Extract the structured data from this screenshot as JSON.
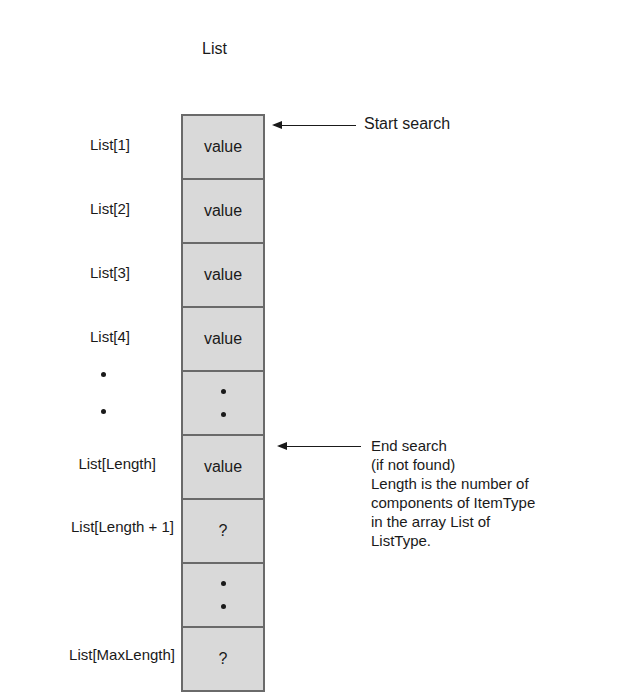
{
  "diagram": {
    "title": "List",
    "cells": [
      {
        "index_label": "List[1]",
        "content": "value",
        "type": "text"
      },
      {
        "index_label": "List[2]",
        "content": "value",
        "type": "text"
      },
      {
        "index_label": "List[3]",
        "content": "value",
        "type": "text"
      },
      {
        "index_label": "List[4]",
        "content": "value",
        "type": "text"
      },
      {
        "index_label": "",
        "content": "",
        "type": "ellipsis"
      },
      {
        "index_label": "List[Length]",
        "content": "value",
        "type": "text"
      },
      {
        "index_label": "List[Length + 1]",
        "content": "?",
        "type": "text"
      },
      {
        "index_label": "",
        "content": "",
        "type": "ellipsis"
      },
      {
        "index_label": "List[MaxLength]",
        "content": "?",
        "type": "text"
      }
    ],
    "annotations": {
      "start": "Start search",
      "end_line1": "End search",
      "end_line2": "(if not found)",
      "note_line1": "Length is the number of",
      "note_line2": "components of ItemType",
      "note_line3": "in the array List of",
      "note_line4": "ListType."
    },
    "colors": {
      "cell_fill": "#d9d9d9",
      "border": "#6a6a6a",
      "text": "#1a1a1a"
    }
  }
}
